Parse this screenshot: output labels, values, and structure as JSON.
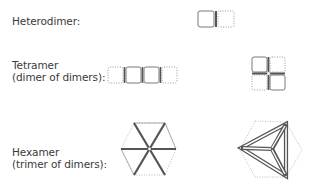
{
  "rows": [
    {
      "id": "heterodimer",
      "label_lines": [
        "Heterodimer:"
      ]
    },
    {
      "id": "tetramer",
      "label_lines": [
        "Tetramer",
        "(dimer of dimers):"
      ]
    },
    {
      "id": "hexamer",
      "label_lines": [
        "Hexamer",
        "(trimer of dimers):"
      ]
    }
  ],
  "legend": {
    "solid_subunit": "solid outline = subunit A",
    "dotted_subunit": "dotted outline = subunit B",
    "thick_line": "thick line = interface"
  },
  "colors": {
    "solid_stroke": "#7a7a7a",
    "dotted_stroke": "#9a9a9a",
    "interface_stroke": "#555555",
    "text": "#3a3a3a"
  }
}
